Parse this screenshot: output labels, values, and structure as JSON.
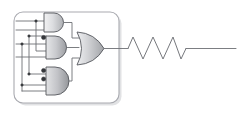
{
  "figure": {
    "type": "circuit-schematic",
    "background_color": "#ffffff",
    "width": 248,
    "height": 113
  },
  "palette": {
    "wire": "#6d6f74",
    "wire_light": "#88898e",
    "gate_stroke": "#55575c",
    "gate_fill_light": "#e9eaec",
    "gate_fill_dark": "#b9babd",
    "block_stroke": "#a9aab0",
    "bubble": "#35373b",
    "junction": "#3a3c40",
    "zigzag": "#76787d"
  },
  "logic_block": {
    "label": "pld-block",
    "shape": "rounded-rectangle",
    "x": 14,
    "y": 12,
    "width": 105,
    "height": 91,
    "corner_radius": 9
  },
  "input_bus": {
    "label": "input-bus",
    "line_count": 4,
    "lines": [
      {
        "name": "bus-line-1",
        "y": 21,
        "x_start": 16,
        "x_end": 55
      },
      {
        "name": "bus-line-2",
        "y": 30,
        "x_start": 16,
        "x_end": 55
      },
      {
        "name": "bus-line-3",
        "y": 44,
        "x_start": 16,
        "x_end": 55
      },
      {
        "name": "bus-line-4",
        "y": 57,
        "x_start": 16,
        "x_end": 55
      }
    ],
    "verticals": [
      {
        "name": "bus-vertical-a",
        "x": 22,
        "y_start": 18,
        "y_end": 96
      },
      {
        "name": "bus-vertical-b",
        "x": 29,
        "y_start": 18,
        "y_end": 88
      },
      {
        "name": "bus-vertical-c",
        "x": 36,
        "y_start": 21,
        "y_end": 78
      }
    ],
    "junctions": [
      {
        "name": "junction-1",
        "x": 36,
        "y": 21
      },
      {
        "name": "junction-2",
        "x": 29,
        "y": 36
      },
      {
        "name": "junction-3",
        "x": 22,
        "y": 44
      },
      {
        "name": "junction-4",
        "x": 29,
        "y": 74
      },
      {
        "name": "junction-5",
        "x": 22,
        "y": 85
      }
    ]
  },
  "gates": [
    {
      "name": "and-gate-top",
      "type": "AND",
      "x": 43,
      "y": 13,
      "width": 21,
      "height": 19,
      "inverted_inputs": 0,
      "input_count": 2,
      "output_label": "and-top-output"
    },
    {
      "name": "and-gate-middle",
      "type": "AND",
      "x": 43,
      "y": 36,
      "width": 21,
      "height": 23,
      "inverted_inputs": 1,
      "input_count": 3,
      "output_label": "and-middle-output"
    },
    {
      "name": "and-gate-bottom",
      "type": "AND",
      "x": 43,
      "y": 67,
      "width": 21,
      "height": 28,
      "inverted_inputs": 2,
      "input_count": 3,
      "output_label": "and-bottom-output"
    },
    {
      "name": "or-gate",
      "type": "OR",
      "x": 76,
      "y": 32,
      "width": 28,
      "height": 33,
      "inverted_inputs": 0,
      "input_count": 3,
      "output_label": "or-output"
    }
  ],
  "output_net": {
    "name": "output-net",
    "from_x": 104,
    "to_x": 128,
    "y": 48
  },
  "resistor": {
    "name": "resistor-zigzag",
    "x_start": 128,
    "x_end": 181,
    "y_center": 48,
    "peak_count": 5,
    "amplitude": 11,
    "lead_right_x": 236
  },
  "icons": {
    "and_gate": "and-gate-icon",
    "or_gate": "or-gate-icon",
    "inversion_bubble": "inversion-bubble-icon",
    "junction_dot": "junction-dot-icon",
    "resistor": "resistor-icon"
  }
}
